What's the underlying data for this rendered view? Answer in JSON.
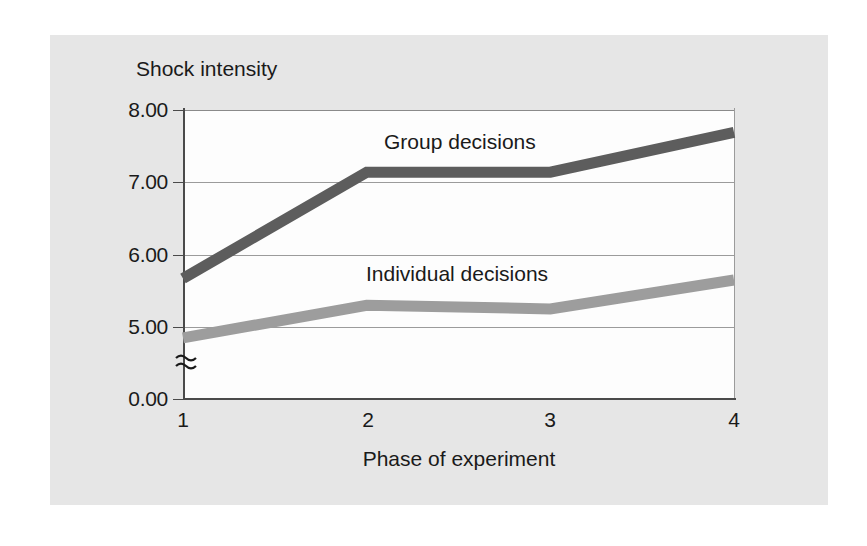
{
  "figure": {
    "background_color": "#e6e6e6",
    "plot_background_color": "#fdfdfd"
  },
  "chart_data": {
    "type": "line",
    "title": "",
    "xlabel": "Phase of experiment",
    "ylabel": "Shock intensity",
    "categories": [
      "1",
      "2",
      "3",
      "4"
    ],
    "x": [
      1,
      2,
      3,
      4
    ],
    "xtick_labels": [
      "1",
      "2",
      "3",
      "4"
    ],
    "ytick_labels": [
      "0.00",
      "5.00",
      "6.00",
      "7.00",
      "8.00"
    ],
    "ytick_values": [
      0.0,
      5.0,
      6.0,
      7.0,
      8.0
    ],
    "ylim": [
      0.0,
      8.0
    ],
    "axis_break": true,
    "axis_break_note": "≈",
    "grid": true,
    "grid_axis": "y",
    "legend_position": "inline-annotations",
    "series": [
      {
        "name": "Group decisions",
        "label": "Group decisions",
        "color": "#5d5d5d",
        "values": [
          5.67,
          7.14,
          7.14,
          7.69
        ]
      },
      {
        "name": "Individual decisions",
        "label": "Individual decisions",
        "color": "#9d9d9d",
        "values": [
          4.85,
          5.3,
          5.25,
          5.65
        ]
      }
    ],
    "annotations": [
      {
        "text": "Group decisions",
        "series": "Group decisions"
      },
      {
        "text": "Individual decisions",
        "series": "Individual decisions"
      }
    ]
  },
  "axes": {
    "y_title": "Shock intensity",
    "x_title": "Phase of experiment",
    "y_labels": {
      "t8": "8.00",
      "t7": "7.00",
      "t6": "6.00",
      "t5": "5.00",
      "t0": "0.00"
    },
    "x_labels": {
      "p1": "1",
      "p2": "2",
      "p3": "3",
      "p4": "4"
    }
  }
}
